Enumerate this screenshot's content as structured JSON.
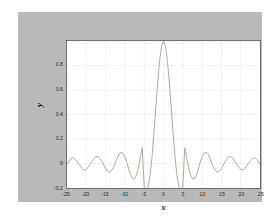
{
  "figure": {
    "background_color": "#b9b9b9",
    "page_color": "#ffffff",
    "axes_background": "#ffffff",
    "axes_border_color": "#6e6e6e",
    "grid_color": "#c9c9c9",
    "curve_color": "#b0a99a"
  },
  "labels": {
    "xlabel": "x",
    "ylabel": "y"
  },
  "chart_data": {
    "type": "line",
    "title": "",
    "subtitle": "",
    "xlabel": "x",
    "ylabel": "y",
    "xlim": [
      -25,
      25
    ],
    "ylim": [
      -0.2,
      1.0
    ],
    "xticks": [
      -25,
      -20,
      -15,
      -10,
      -5,
      0,
      5,
      10,
      15,
      20,
      25
    ],
    "xticklabels": [
      "-25",
      "-20",
      "-15",
      "-10",
      "-5",
      "0",
      "5",
      "10",
      "15",
      "20",
      "25"
    ],
    "yticks": [
      -0.2,
      0,
      0.2,
      0.4,
      0.6,
      0.8
    ],
    "yticklabels": [
      "-0.2",
      "0",
      "0.2",
      "0.4",
      "0.6",
      "0.8"
    ],
    "grid": true,
    "grid_style": "dotted",
    "legend": null,
    "legend_position": "none",
    "annotations": [],
    "series": [
      {
        "name": "sinc",
        "formula": "y = sin(x)/x",
        "color": "#b0a99a",
        "linewidth": 1,
        "x": [
          -25.0,
          -24.5,
          -24.0,
          -23.5,
          -23.0,
          -22.5,
          -22.0,
          -21.5,
          -21.0,
          -20.5,
          -20.0,
          -19.5,
          -19.0,
          -18.5,
          -18.0,
          -17.5,
          -17.0,
          -16.5,
          -16.0,
          -15.5,
          -15.0,
          -14.5,
          -14.0,
          -13.5,
          -13.0,
          -12.5,
          -12.0,
          -11.5,
          -11.0,
          -10.5,
          -10.0,
          -9.5,
          -9.0,
          -8.5,
          -8.0,
          -7.5,
          -7.0,
          -6.5,
          -6.0,
          -5.5,
          -5.0,
          -4.5,
          -4.0,
          -3.5,
          -3.0,
          -2.5,
          -2.0,
          -1.5,
          -1.0,
          -0.5,
          0.0,
          0.5,
          1.0,
          1.5,
          2.0,
          2.5,
          3.0,
          3.5,
          4.0,
          4.5,
          5.0,
          5.5,
          6.0,
          6.5,
          7.0,
          7.5,
          8.0,
          8.5,
          9.0,
          9.5,
          10.0,
          10.5,
          11.0,
          11.5,
          12.0,
          12.5,
          13.0,
          13.5,
          14.0,
          14.5,
          15.0,
          15.5,
          16.0,
          16.5,
          17.0,
          17.5,
          18.0,
          18.5,
          19.0,
          19.5,
          20.0,
          20.5,
          21.0,
          21.5,
          22.0,
          22.5,
          23.0,
          23.5,
          24.0,
          24.5,
          25.0
        ],
        "y": [
          -0.0053,
          0.0187,
          0.0378,
          0.049,
          0.0368,
          0.0213,
          0.0004,
          -0.0216,
          -0.0408,
          -0.0536,
          -0.0456,
          -0.031,
          -0.0078,
          0.0163,
          0.0416,
          0.0557,
          0.0565,
          0.0428,
          0.018,
          -0.0102,
          -0.0434,
          -0.0616,
          -0.0709,
          -0.0598,
          -0.0323,
          0.0053,
          0.0447,
          0.0783,
          0.0909,
          0.0854,
          0.0544,
          0.0079,
          -0.0458,
          -0.0938,
          -0.1237,
          -0.1252,
          -0.0939,
          -0.0334,
          0.0466,
          0.1297,
          -0.1918,
          -0.2172,
          -0.1892,
          -0.1002,
          0.047,
          0.2394,
          0.4546,
          0.665,
          0.8415,
          0.9589,
          1.0,
          0.9589,
          0.8415,
          0.665,
          0.4546,
          0.2394,
          0.047,
          -0.1002,
          -0.1892,
          -0.2172,
          -0.1918,
          0.1297,
          0.0466,
          -0.0334,
          -0.0939,
          -0.1252,
          -0.1237,
          -0.0938,
          -0.0458,
          0.0079,
          0.0544,
          0.0854,
          0.0909,
          0.0783,
          0.0447,
          0.0053,
          -0.0323,
          -0.0598,
          -0.0709,
          -0.0616,
          -0.0434,
          -0.0102,
          0.018,
          0.0428,
          0.0565,
          0.0557,
          0.0416,
          0.0163,
          -0.0078,
          -0.031,
          -0.0456,
          -0.0536,
          -0.0408,
          -0.0216,
          0.0004,
          0.0213,
          0.0368,
          0.049,
          0.0378,
          0.0187,
          -0.0053
        ]
      }
    ]
  }
}
